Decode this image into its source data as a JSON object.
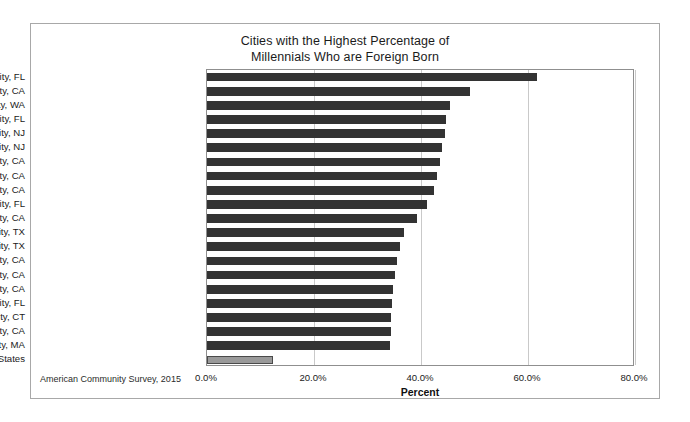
{
  "chart_data": {
    "type": "bar",
    "orientation": "horizontal",
    "title": "Cities with the Highest Percentage of Millennials Who are Foreign Born",
    "title_lines": [
      "Cities with the Highest Percentage of",
      "Millennials Who are Foreign Born"
    ],
    "xlabel": "Percent",
    "ylabel": "",
    "xlim": [
      0,
      80
    ],
    "xticks": [
      0,
      20,
      40,
      60,
      80
    ],
    "xtick_labels": [
      "0.0%",
      "20.0%",
      "40.0%",
      "60.0%",
      "80.0%"
    ],
    "grid": true,
    "grid_axis": "x",
    "legend": "none",
    "source_note": "American Community Survey, 2015",
    "bar_color": "#333333",
    "highlight_color": "#9a9a9a",
    "highlight_category": "United States",
    "categories": [
      "Hialeah city, FL",
      "Sunnyvale city, CA",
      "Bellevue city, WA",
      "Miami city, FL",
      "Elizabeth city, NJ",
      "Jersey City city, NJ",
      "Santa Clara city, CA",
      "Fremont city, CA",
      "Glendale city, CA",
      "Miami Beach city, FL",
      "Richmond city, CA",
      "Richardson city, TX",
      "Irving city, TX",
      "Santa Ana city, CA",
      "Irvine city, CA",
      "San Mateo city, CA",
      "Plantation city, FL",
      "Stamford city, CT",
      "Salinas city, CA",
      "Lowell city, MA",
      "United States"
    ],
    "values": [
      61.7,
      49.2,
      45.4,
      44.6,
      44.4,
      44.0,
      43.6,
      43.0,
      42.4,
      41.1,
      39.3,
      36.8,
      36.1,
      35.6,
      35.2,
      34.8,
      34.6,
      34.4,
      34.3,
      34.2,
      12.3
    ]
  }
}
